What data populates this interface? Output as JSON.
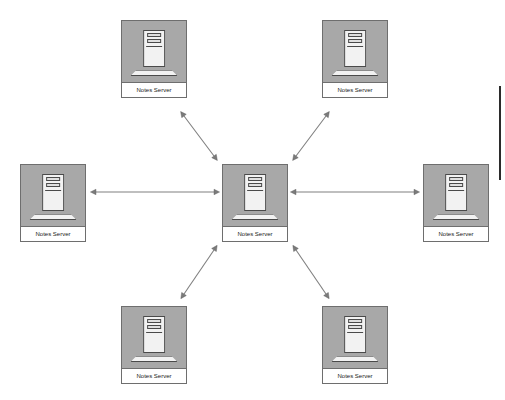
{
  "diagram": {
    "type": "hub-and-spoke",
    "background_color": "#ffffff",
    "node_fill_color": "#a8a8a8",
    "node_border_color": "#6e6e6e",
    "label_background_color": "#ffffff",
    "connector_color": "#808080",
    "rule_color": "#2b2b2b",
    "nodes": [
      {
        "id": "hub",
        "label": "Notes Server",
        "role": "hub",
        "x": 222,
        "y": 164,
        "w": 66,
        "h": 78
      },
      {
        "id": "spoke-top-left",
        "label": "Notes Server",
        "role": "spoke",
        "x": 121,
        "y": 20,
        "w": 66,
        "h": 78
      },
      {
        "id": "spoke-top-right",
        "label": "Notes Server",
        "role": "spoke",
        "x": 322,
        "y": 20,
        "w": 66,
        "h": 78
      },
      {
        "id": "spoke-left",
        "label": "Notes Server",
        "role": "spoke",
        "x": 20,
        "y": 164,
        "w": 66,
        "h": 78
      },
      {
        "id": "spoke-right",
        "label": "Notes Server",
        "role": "spoke",
        "x": 423,
        "y": 164,
        "w": 66,
        "h": 78
      },
      {
        "id": "spoke-bottom-left",
        "label": "Notes Server",
        "role": "spoke",
        "x": 121,
        "y": 306,
        "w": 66,
        "h": 78
      },
      {
        "id": "spoke-bottom-right",
        "label": "Notes Server",
        "role": "spoke",
        "x": 322,
        "y": 306,
        "w": 66,
        "h": 78
      }
    ],
    "connections": [
      {
        "id": "conn-hub-top-left",
        "from": "hub",
        "to": "spoke-top-left",
        "style": "double-arrow",
        "x1": 214,
        "y1": 156,
        "x2": 184,
        "y2": 116
      },
      {
        "id": "conn-hub-top-right",
        "from": "hub",
        "to": "spoke-top-right",
        "style": "double-arrow",
        "x1": 296,
        "y1": 156,
        "x2": 326,
        "y2": 116
      },
      {
        "id": "conn-hub-left",
        "from": "hub",
        "to": "spoke-left",
        "style": "double-arrow",
        "x1": 214,
        "y1": 192,
        "x2": 96,
        "y2": 192
      },
      {
        "id": "conn-hub-right",
        "from": "hub",
        "to": "spoke-right",
        "style": "double-arrow",
        "x1": 296,
        "y1": 192,
        "x2": 414,
        "y2": 192
      },
      {
        "id": "conn-hub-bottom-left",
        "from": "hub",
        "to": "spoke-bottom-left",
        "style": "double-arrow",
        "x1": 214,
        "y1": 250,
        "x2": 184,
        "y2": 294
      },
      {
        "id": "conn-hub-bottom-right",
        "from": "hub",
        "to": "spoke-bottom-right",
        "style": "double-arrow",
        "x1": 296,
        "y1": 250,
        "x2": 326,
        "y2": 294
      }
    ],
    "decorations": [
      {
        "id": "right-margin-rule",
        "type": "vertical-rule",
        "x": 499,
        "y": 86,
        "w": 2,
        "h": 94
      }
    ]
  }
}
